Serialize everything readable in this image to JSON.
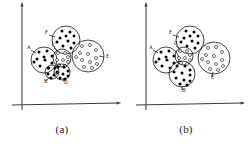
{
  "figure": {
    "type": "cluster-diagram",
    "panel_count": 2,
    "background": "#ffffff",
    "ink_color": "#111111",
    "axis_color": "#3a3a3a"
  },
  "chart_data": {
    "type": "scatter",
    "title": "",
    "xlabel": "",
    "ylabel": "",
    "grid": false,
    "legend": "none",
    "axis_style": "two-arrows-origin-lower-left",
    "marker_types": [
      "filled",
      "open"
    ],
    "panels": [
      {
        "id": "a",
        "caption": "(a)",
        "axes": {
          "x": {
            "x1": 12,
            "y1": 105,
            "x2": 118,
            "y2": 103,
            "arrow": true
          },
          "y": {
            "x1": 22,
            "y1": 110,
            "x2": 22,
            "y2": 5,
            "arrow": true
          }
        },
        "clusters": [
          {
            "label": "F",
            "cx": 66,
            "cy": 40,
            "r": 14,
            "marker": "filled",
            "label_x": 45,
            "label_y": 34,
            "lead": [
              [
                49,
                35
              ],
              [
                55,
                37
              ]
            ],
            "points": [
              [
                62,
                31
              ],
              [
                70,
                32
              ],
              [
                74,
                36
              ],
              [
                60,
                38
              ],
              [
                68,
                41
              ],
              [
                74,
                43
              ],
              [
                63,
                46
              ],
              [
                71,
                48
              ],
              [
                57,
                42
              ],
              [
                66,
                36
              ]
            ]
          },
          {
            "label": "E",
            "cx": 88,
            "cy": 56,
            "r": 16,
            "marker": "open",
            "label_x": 106,
            "label_y": 58,
            "lead": [
              [
                104,
                57
              ],
              [
                99,
                56
              ]
            ],
            "points": [
              [
                82,
                46
              ],
              [
                90,
                45
              ],
              [
                96,
                50
              ],
              [
                80,
                53
              ],
              [
                88,
                54
              ],
              [
                96,
                58
              ],
              [
                82,
                60
              ],
              [
                90,
                62
              ],
              [
                97,
                64
              ],
              [
                84,
                67
              ],
              [
                92,
                68
              ],
              [
                76,
                57
              ]
            ]
          },
          {
            "label": "A",
            "cx": 44,
            "cy": 60,
            "r": 13,
            "marker": "filled",
            "label_x": 27,
            "label_y": 49,
            "lead": [
              [
                31,
                50
              ],
              [
                36,
                53
              ]
            ],
            "points": [
              [
                39,
                52
              ],
              [
                47,
                51
              ],
              [
                52,
                56
              ],
              [
                37,
                59
              ],
              [
                45,
                60
              ],
              [
                52,
                63
              ],
              [
                40,
                66
              ],
              [
                48,
                68
              ],
              [
                34,
                62
              ],
              [
                44,
                57
              ]
            ]
          },
          {
            "label": "C",
            "cx": 62,
            "cy": 58,
            "r": 9,
            "marker": "open",
            "label_x": 52,
            "label_y": 47,
            "lead": [
              [
                54,
                48
              ],
              [
                58,
                51
              ]
            ],
            "points": [
              [
                58,
                53
              ],
              [
                65,
                53
              ],
              [
                68,
                57
              ],
              [
                57,
                60
              ],
              [
                63,
                60
              ],
              [
                68,
                62
              ],
              [
                59,
                65
              ],
              [
                65,
                66
              ]
            ]
          },
          {
            "label": "D",
            "cx": 62,
            "cy": 72,
            "r": 8,
            "marker": "filled",
            "label_x": 64,
            "label_y": 84,
            "lead": [
              [
                64,
                82
              ],
              [
                63,
                78
              ]
            ],
            "points": [
              [
                58,
                67
              ],
              [
                64,
                67
              ],
              [
                68,
                71
              ],
              [
                57,
                73
              ],
              [
                63,
                74
              ],
              [
                68,
                76
              ],
              [
                60,
                78
              ],
              [
                65,
                79
              ]
            ]
          },
          {
            "label": "B",
            "cx": 52,
            "cy": 72,
            "r": 7,
            "marker": "filled",
            "label_x": 44,
            "label_y": 83,
            "lead": [
              [
                46,
                81
              ],
              [
                50,
                77
              ]
            ],
            "points": [
              [
                49,
                68
              ],
              [
                55,
                68
              ],
              [
                57,
                72
              ],
              [
                48,
                74
              ],
              [
                54,
                75
              ],
              [
                51,
                78
              ]
            ]
          }
        ]
      },
      {
        "id": "b",
        "caption": "(b)",
        "axes": {
          "x": {
            "x1": 12,
            "y1": 105,
            "x2": 118,
            "y2": 103,
            "arrow": true
          },
          "y": {
            "x1": 22,
            "y1": 110,
            "x2": 22,
            "y2": 5,
            "arrow": true
          }
        },
        "clusters": [
          {
            "label": "F",
            "cx": 66,
            "cy": 40,
            "r": 14,
            "marker": "filled",
            "label_x": 45,
            "label_y": 34,
            "lead": [
              [
                49,
                35
              ],
              [
                55,
                37
              ]
            ],
            "points": [
              [
                62,
                31
              ],
              [
                70,
                32
              ],
              [
                74,
                36
              ],
              [
                60,
                38
              ],
              [
                68,
                41
              ],
              [
                74,
                43
              ],
              [
                63,
                46
              ],
              [
                71,
                48
              ],
              [
                57,
                42
              ],
              [
                66,
                36
              ]
            ]
          },
          {
            "label": "E",
            "cx": 90,
            "cy": 58,
            "r": 16,
            "marker": "open",
            "label_x": 87,
            "label_y": 79,
            "lead": [
              [
                88,
                77
              ],
              [
                89,
                72
              ]
            ],
            "points": [
              [
                84,
                48
              ],
              [
                92,
                47
              ],
              [
                98,
                52
              ],
              [
                82,
                55
              ],
              [
                90,
                56
              ],
              [
                98,
                60
              ],
              [
                84,
                62
              ],
              [
                92,
                64
              ],
              [
                99,
                66
              ],
              [
                86,
                69
              ],
              [
                94,
                70
              ],
              [
                78,
                59
              ]
            ]
          },
          {
            "label": "A",
            "cx": 42,
            "cy": 60,
            "r": 13,
            "marker": "filled",
            "label_x": 25,
            "label_y": 49,
            "lead": [
              [
                29,
                50
              ],
              [
                34,
                53
              ]
            ],
            "points": [
              [
                37,
                52
              ],
              [
                45,
                51
              ],
              [
                50,
                56
              ],
              [
                35,
                59
              ],
              [
                43,
                60
              ],
              [
                50,
                63
              ],
              [
                38,
                66
              ],
              [
                46,
                68
              ],
              [
                32,
                62
              ],
              [
                42,
                57
              ]
            ]
          },
          {
            "label": "C",
            "cx": 60,
            "cy": 56,
            "r": 9,
            "marker": "open",
            "label_x": 50,
            "label_y": 45,
            "lead": [
              [
                52,
                46
              ],
              [
                56,
                49
              ]
            ],
            "points": [
              [
                56,
                51
              ],
              [
                63,
                51
              ],
              [
                66,
                55
              ],
              [
                55,
                58
              ],
              [
                61,
                58
              ],
              [
                66,
                60
              ],
              [
                57,
                63
              ],
              [
                63,
                64
              ]
            ]
          },
          {
            "label": "B",
            "cx": 58,
            "cy": 74,
            "r": 13,
            "marker": "filled",
            "label_x": 58,
            "label_y": 92,
            "lead": [
              [
                58,
                90
              ],
              [
                58,
                86
              ]
            ],
            "points": [
              [
                53,
                66
              ],
              [
                61,
                66
              ],
              [
                66,
                70
              ],
              [
                50,
                72
              ],
              [
                58,
                73
              ],
              [
                66,
                75
              ],
              [
                52,
                78
              ],
              [
                60,
                80
              ],
              [
                66,
                81
              ],
              [
                56,
                84
              ],
              [
                63,
                85
              ]
            ]
          }
        ]
      }
    ]
  }
}
